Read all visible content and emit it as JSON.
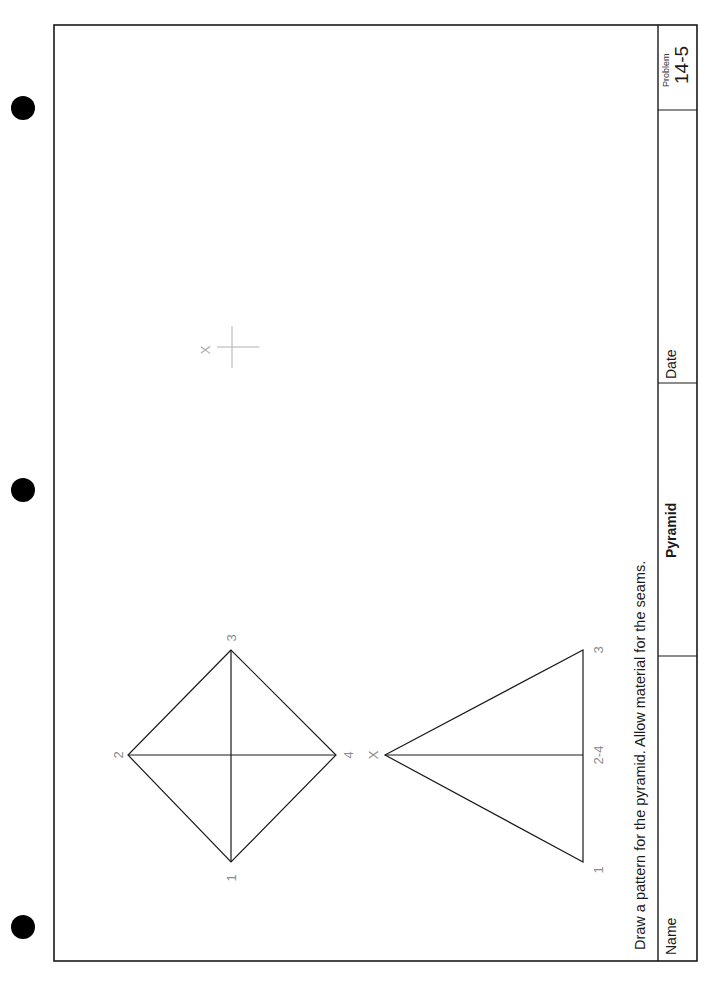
{
  "worksheet": {
    "instruction": "Draw a pattern for the pyramid. Allow material for the seams.",
    "title_block": {
      "name_label": "Name",
      "title": "Pyramid",
      "date_label": "Date",
      "problem_label": "Problem",
      "problem_number": "14-5"
    },
    "top_view": {
      "vertex_labels": [
        "1",
        "2",
        "3",
        "4"
      ]
    },
    "front_view": {
      "apex_label": "X",
      "base_labels": [
        "1",
        "2-4",
        "3"
      ],
      "side_label": "4"
    },
    "layout_marker": {
      "label": "X"
    }
  },
  "colors": {
    "line": "#1a1a1a",
    "label": "#8a8a8a",
    "marker": "#b0b0b0",
    "punch_hole": "#000000"
  }
}
